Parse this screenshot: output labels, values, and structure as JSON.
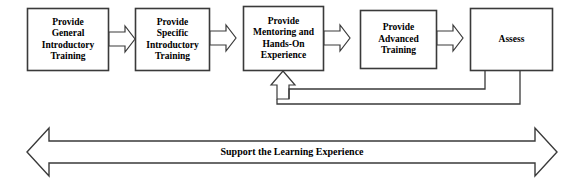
{
  "diagram": {
    "stroke_color": "#3a3a3a",
    "fill_color": "#ffffff",
    "text_color": "#000000",
    "nodes": [
      {
        "id": "general-introductory-training",
        "lines": [
          "Provide",
          "General",
          "Introductory",
          "Training"
        ],
        "x": 27,
        "y": 8,
        "w": 81,
        "h": 62
      },
      {
        "id": "specific-introductory-training",
        "lines": [
          "Provide",
          "Specific",
          "Introductory",
          "Training"
        ],
        "x": 135,
        "y": 8,
        "w": 74,
        "h": 62
      },
      {
        "id": "mentoring-hands-on-experience",
        "lines": [
          "Provide",
          "Mentoring and",
          "Hands-On",
          "Experience"
        ],
        "x": 243,
        "y": 6,
        "w": 80,
        "h": 64
      },
      {
        "id": "advanced-training",
        "lines": [
          "Provide",
          "Advanced",
          "Training"
        ],
        "x": 360,
        "y": 10,
        "w": 76,
        "h": 58
      },
      {
        "id": "assess",
        "lines": [
          "Assess"
        ],
        "x": 470,
        "y": 8,
        "w": 82,
        "h": 62
      }
    ],
    "connectors": [
      {
        "id": "arrow-general-to-specific",
        "from": "general-introductory-training",
        "to": "specific-introductory-training"
      },
      {
        "id": "arrow-specific-to-mentoring",
        "from": "specific-introductory-training",
        "to": "mentoring-hands-on-experience"
      },
      {
        "id": "arrow-mentoring-to-advanced",
        "from": "mentoring-hands-on-experience",
        "to": "advanced-training"
      },
      {
        "id": "arrow-advanced-to-assess",
        "from": "advanced-training",
        "to": "assess"
      },
      {
        "id": "feedback-advanced-to-mentoring",
        "from": "advanced-training",
        "to": "mentoring-hands-on-experience",
        "style": "feedback-loop"
      },
      {
        "id": "feedback-assess-to-mentoring",
        "from": "assess",
        "to": "mentoring-hands-on-experience",
        "style": "feedback-loop"
      }
    ],
    "banner": {
      "id": "support-the-learning-experience",
      "label": "Support the Learning Experience",
      "direction": "bidirectional"
    }
  }
}
